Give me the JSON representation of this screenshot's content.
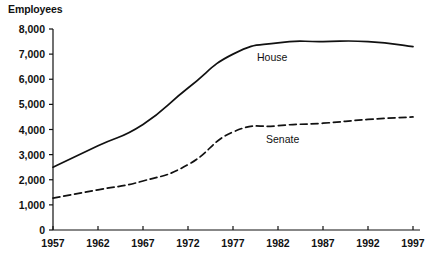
{
  "chart_data": {
    "type": "line",
    "title": "",
    "ylabel": "Employees",
    "xlabel": "",
    "ylim": [
      0,
      8000
    ],
    "xlim": [
      1957,
      1997
    ],
    "grid": false,
    "legend_position": "inline-annotations",
    "ytick_labels": [
      "8,000",
      "7,000",
      "6,000",
      "5,000",
      "4,000",
      "3,000",
      "2,000",
      "1,000",
      "0"
    ],
    "ytick_values": [
      8000,
      7000,
      6000,
      5000,
      4000,
      3000,
      2000,
      1000,
      0
    ],
    "xtick_labels": [
      "1957",
      "1962",
      "1967",
      "1972",
      "1977",
      "1982",
      "1987",
      "1992",
      "1997"
    ],
    "x": [
      1957,
      1962,
      1967,
      1972,
      1977,
      1982,
      1987,
      1992,
      1997
    ],
    "series": [
      {
        "name": "House",
        "style": "solid",
        "color": "#111111",
        "values": [
          2500,
          3350,
          4200,
          5650,
          7000,
          7450,
          7500,
          7500,
          7300
        ]
      },
      {
        "name": "Senate",
        "style": "dashed",
        "color": "#111111",
        "values": [
          1270,
          1600,
          1950,
          2600,
          3900,
          4150,
          4250,
          4400,
          4500
        ]
      }
    ]
  }
}
